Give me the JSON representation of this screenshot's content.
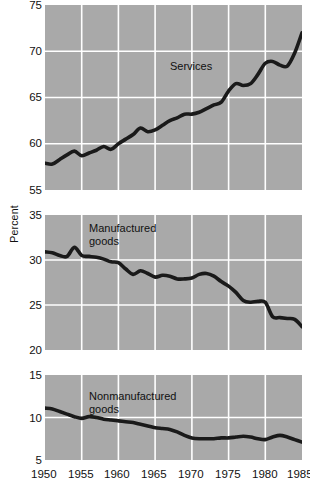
{
  "chart_data": {
    "type": "line",
    "title": "",
    "subtitle": "",
    "xlabel": "",
    "ylabel": "Percent",
    "grid": true,
    "legend_position": "inline-annotation",
    "x_tick_labels": [
      "1950",
      "1955",
      "1960",
      "1965",
      "1970",
      "1975",
      "1980",
      "1985"
    ],
    "x_tick_values": [
      1950,
      1955,
      1960,
      1965,
      1970,
      1975,
      1980,
      1985
    ],
    "xlim": [
      1950,
      1985
    ],
    "panels": [
      {
        "name": "Services",
        "annotation": "Services",
        "ylim": [
          55,
          75
        ],
        "y_tick_labels": [
          "75",
          "70",
          "65",
          "60",
          "55"
        ],
        "y_tick_values": [
          75,
          70,
          65,
          60,
          55
        ],
        "x": [
          1950,
          1951,
          1952,
          1953,
          1954,
          1955,
          1956,
          1957,
          1958,
          1959,
          1960,
          1961,
          1962,
          1963,
          1964,
          1965,
          1966,
          1967,
          1968,
          1969,
          1970,
          1971,
          1972,
          1973,
          1974,
          1975,
          1976,
          1977,
          1978,
          1979,
          1980,
          1981,
          1982,
          1983,
          1984,
          1985
        ],
        "values": [
          57.9,
          57.8,
          58.3,
          58.8,
          59.2,
          58.7,
          59.0,
          59.3,
          59.7,
          59.4,
          60.0,
          60.5,
          61.0,
          61.7,
          61.3,
          61.5,
          62.0,
          62.5,
          62.8,
          63.2,
          63.2,
          63.4,
          63.8,
          64.2,
          64.5,
          65.7,
          66.5,
          66.3,
          66.5,
          67.5,
          68.7,
          68.9,
          68.5,
          68.4,
          69.8,
          72.0
        ]
      },
      {
        "name": "Manufactured goods",
        "annotation": "Manufactured\ngoods",
        "ylim": [
          20,
          35
        ],
        "y_tick_labels": [
          "35",
          "30",
          "25",
          "20"
        ],
        "y_tick_values": [
          35,
          30,
          25,
          20
        ],
        "x": [
          1950,
          1951,
          1952,
          1953,
          1954,
          1955,
          1956,
          1957,
          1958,
          1959,
          1960,
          1961,
          1962,
          1963,
          1964,
          1965,
          1966,
          1967,
          1968,
          1969,
          1970,
          1971,
          1972,
          1973,
          1974,
          1975,
          1976,
          1977,
          1978,
          1979,
          1980,
          1981,
          1982,
          1983,
          1984,
          1985
        ],
        "values": [
          30.9,
          30.8,
          30.5,
          30.4,
          31.4,
          30.5,
          30.4,
          30.3,
          30.1,
          29.8,
          29.7,
          29.0,
          28.4,
          28.8,
          28.5,
          28.1,
          28.3,
          28.2,
          27.9,
          27.9,
          28.0,
          28.4,
          28.5,
          28.2,
          27.6,
          27.1,
          26.4,
          25.5,
          25.3,
          25.4,
          25.3,
          23.7,
          23.6,
          23.5,
          23.4,
          22.6,
          20.4
        ]
      },
      {
        "name": "Nonmanufactured goods",
        "annotation": "Nonmanufactured\ngoods",
        "ylim": [
          5,
          15
        ],
        "y_tick_labels": [
          "15",
          "10",
          "5"
        ],
        "y_tick_values": [
          15,
          10,
          5
        ],
        "x": [
          1950,
          1951,
          1952,
          1953,
          1954,
          1955,
          1956,
          1957,
          1958,
          1959,
          1960,
          1961,
          1962,
          1963,
          1964,
          1965,
          1966,
          1967,
          1968,
          1969,
          1970,
          1971,
          1972,
          1973,
          1974,
          1975,
          1976,
          1977,
          1978,
          1979,
          1980,
          1981,
          1982,
          1983,
          1984,
          1985
        ],
        "values": [
          11.1,
          11.0,
          10.7,
          10.4,
          10.1,
          9.9,
          10.1,
          10.0,
          9.8,
          9.7,
          9.6,
          9.5,
          9.4,
          9.2,
          9.0,
          8.8,
          8.7,
          8.6,
          8.3,
          7.9,
          7.6,
          7.5,
          7.5,
          7.5,
          7.6,
          7.6,
          7.7,
          7.8,
          7.7,
          7.5,
          7.4,
          7.7,
          7.9,
          7.7,
          7.4,
          7.1
        ]
      }
    ]
  },
  "figure": {
    "background_color": "#ffffff",
    "plot_background_color": "#a9a9a9",
    "gridline_color": "#ffffff",
    "line_color": "#1a1a1a",
    "text_color": "#111111"
  }
}
